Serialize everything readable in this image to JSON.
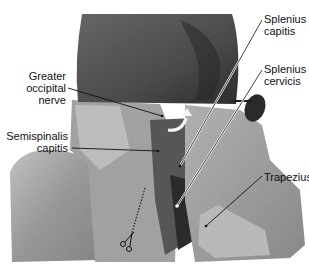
{
  "figure": {
    "labels": [
      {
        "id": "greater-occipital-nerve",
        "lines": [
          "Greater",
          "occipital",
          "nerve"
        ]
      },
      {
        "id": "semispinalis-capitis",
        "lines": [
          "Semispinalis",
          "capitis"
        ]
      },
      {
        "id": "splenius-capitis",
        "lines": [
          "Splenius",
          "capitis"
        ]
      },
      {
        "id": "splenius-cervicis",
        "lines": [
          "Splenius",
          "cervicis"
        ]
      },
      {
        "id": "trapezius",
        "lines": [
          "Trapezius"
        ]
      }
    ]
  }
}
